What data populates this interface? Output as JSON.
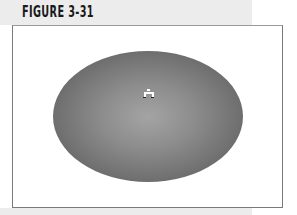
{
  "figure": {
    "label": "FIGURE 3-31"
  },
  "canvas": {
    "shape": "ellipse",
    "fill": "radial-gradient",
    "gradient_colors": [
      "#a4a4a4",
      "#505050"
    ],
    "cursor_icon": "gradient-tool-cursor-icon"
  }
}
